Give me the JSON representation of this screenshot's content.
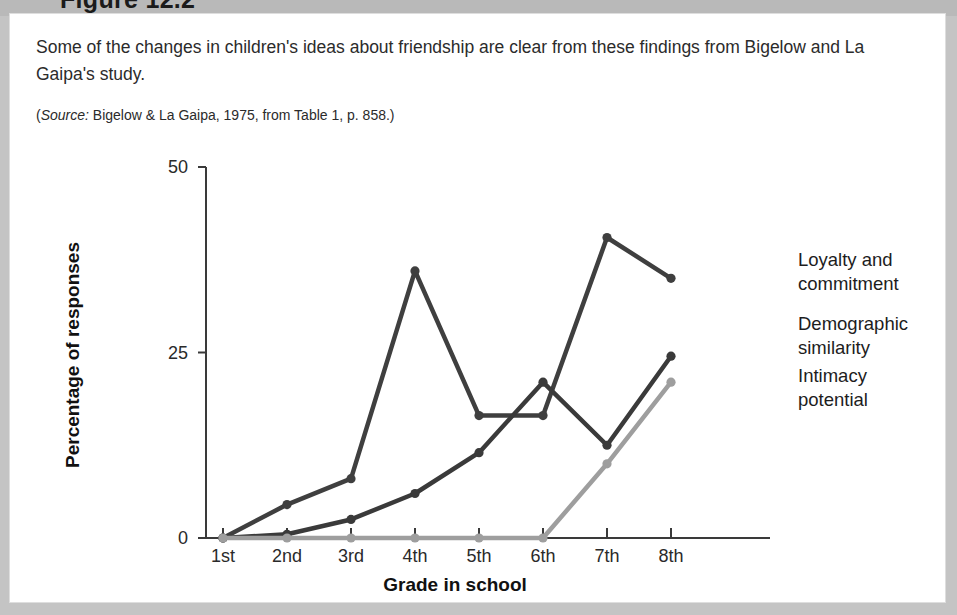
{
  "figure": {
    "title": "Figure 12.2",
    "caption": "Some of the changes in children's ideas about friendship are clear from these findings from Bigelow and La Gaipa's study.",
    "source_prefix": "Source:",
    "source_text": " Bigelow & La Gaipa, 1975, from Table 1, p. 858.)",
    "source_open_paren": "("
  },
  "chart_data": {
    "type": "line",
    "title": "",
    "xlabel": "Grade in school",
    "ylabel": "Percentage of responses",
    "categories": [
      "1st",
      "2nd",
      "3rd",
      "4th",
      "5th",
      "6th",
      "7th",
      "8th"
    ],
    "ylim": [
      0,
      50
    ],
    "yticks": [
      0,
      25,
      50
    ],
    "ytick_labels": [
      "0",
      "25",
      "50"
    ],
    "grid": false,
    "legend_position": "right-inline",
    "series": [
      {
        "name": "Loyalty and commitment",
        "label_line1": "Loyalty and",
        "label_line2": "commitment",
        "color": "#3f3f3f",
        "values": [
          0,
          4.5,
          8,
          36,
          16.5,
          16.5,
          40.5,
          35
        ]
      },
      {
        "name": "Demographic similarity",
        "label_line1": "Demographic",
        "label_line2": "similarity",
        "color": "#3a3a3a",
        "values": [
          0,
          0.5,
          2.5,
          6,
          11.5,
          21,
          12.5,
          24.5
        ]
      },
      {
        "name": "Intimacy potential",
        "label_line1": "Intimacy",
        "label_line2": "potential",
        "color": "#9e9e9e",
        "values": [
          0,
          0,
          0,
          0,
          0,
          0,
          10,
          21
        ]
      }
    ]
  }
}
